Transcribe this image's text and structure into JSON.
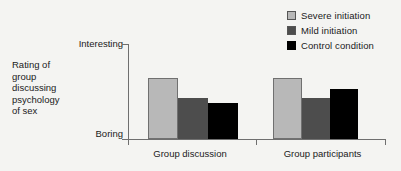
{
  "chart_data": {
    "type": "bar",
    "title": "",
    "subtitle": "",
    "xlabel": "",
    "ylabel": "Rating of group discussing psychology of sex",
    "ylabel_lines": [
      "Rating of",
      "group",
      "discussing",
      "psychology",
      "of sex"
    ],
    "categories": [
      "Group discussion",
      "Group participants"
    ],
    "y_axis_ticks": [
      "Interesting",
      "Boring"
    ],
    "y_axis_top_label": "Interesting",
    "y_axis_bottom_label": "Boring",
    "ylim": [
      0,
      100
    ],
    "grid": false,
    "legend_position": "top-right",
    "series": [
      {
        "name": "Severe initiation",
        "color": "#b8b8b8",
        "border": "#707070",
        "values": [
          64,
          64
        ]
      },
      {
        "name": "Mild initiation",
        "color": "#4d4d4d",
        "border": "#4d4d4d",
        "values": [
          43,
          43
        ]
      },
      {
        "name": "Control condition",
        "color": "#000000",
        "border": "#000000",
        "values": [
          38,
          53
        ]
      }
    ]
  },
  "legend": {
    "items": [
      {
        "label": "Severe initiation",
        "color": "#b8b8b8"
      },
      {
        "label": "Mild initiation",
        "color": "#4d4d4d"
      },
      {
        "label": "Control condition",
        "color": "#000000"
      }
    ]
  },
  "axes": {
    "y_top": "Interesting",
    "y_bottom": "Boring",
    "y_title_lines": [
      "Rating of",
      "group",
      "discussing",
      "psychology",
      "of sex"
    ],
    "categories": [
      "Group discussion",
      "Group participants"
    ]
  },
  "colors": {
    "background": "#f4f4f2",
    "axis": "#6f6f6f",
    "text": "#1a1a1a",
    "severe": "#b8b8b8",
    "mild": "#4d4d4d",
    "control": "#000000"
  }
}
